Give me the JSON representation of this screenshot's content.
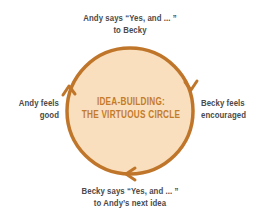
{
  "diagram": {
    "title_line1": "IDEA-BUILDING:",
    "title_line2": "THE VIRTUOUS CIRCLE",
    "nodes": {
      "top_line1": "Andy says “Yes, and ... ”",
      "top_line2": "to Becky",
      "right_line1": "Becky feels",
      "right_line2": "encouraged",
      "bottom_line1": "Becky says “Yes, and ... ”",
      "bottom_line2": "to Andy’s next idea",
      "left_line1": "Andy feels",
      "left_line2": "good"
    },
    "colors": {
      "circle_fill": "#f9dfbd",
      "circle_stroke": "#c0762a",
      "title_text": "#c47b2a",
      "label_text": "#4a4a4a"
    },
    "flow": "clockwise"
  }
}
